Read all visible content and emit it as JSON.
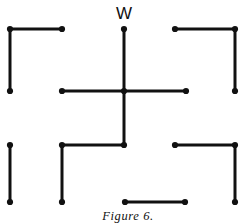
{
  "figure": {
    "caption": "Figure 6.",
    "caption_x": 128,
    "caption_y": 209,
    "vertex_label": "W",
    "vertex_label_x": 124,
    "vertex_label_y": 22,
    "ink_color": "#111111",
    "background_color": "#ffffff",
    "stroke_width": 3,
    "dot_radius": 3.1,
    "width": 242,
    "height": 224
  },
  "chart_data": {
    "type": "diagram",
    "title": "Figure 6.",
    "grid_x": [
      10,
      62,
      124,
      186,
      235
    ],
    "grid_y": [
      29,
      91,
      145,
      202
    ],
    "annotations": [
      {
        "text": "W",
        "x": 124,
        "y": 22,
        "anchor": "bottom-center"
      },
      {
        "text": "Figure 6.",
        "x": 128,
        "y": 209,
        "anchor": "top-center"
      }
    ],
    "segments": [
      {
        "name": "top-left-horizontal",
        "x1": 10,
        "y1": 29,
        "x2": 62,
        "y2": 29
      },
      {
        "name": "top-left-vertical",
        "x1": 10,
        "y1": 29,
        "x2": 10,
        "y2": 91
      },
      {
        "name": "top-center-vertical",
        "x1": 124,
        "y1": 29,
        "x2": 124,
        "y2": 91
      },
      {
        "name": "top-right-horizontal",
        "x1": 175,
        "y1": 29,
        "x2": 235,
        "y2": 29
      },
      {
        "name": "top-right-vertical",
        "x1": 235,
        "y1": 29,
        "x2": 235,
        "y2": 91
      },
      {
        "name": "center-left-horizontal",
        "x1": 62,
        "y1": 91,
        "x2": 124,
        "y2": 91
      },
      {
        "name": "center-right-horizontal",
        "x1": 124,
        "y1": 91,
        "x2": 186,
        "y2": 91
      },
      {
        "name": "center-down-vertical",
        "x1": 124,
        "y1": 91,
        "x2": 124,
        "y2": 145
      },
      {
        "name": "lower-center-horizontal",
        "x1": 62,
        "y1": 145,
        "x2": 124,
        "y2": 145
      },
      {
        "name": "bottom-left-vertical",
        "x1": 10,
        "y1": 145,
        "x2": 10,
        "y2": 202
      },
      {
        "name": "bottom-mid-vertical",
        "x1": 62,
        "y1": 145,
        "x2": 62,
        "y2": 202
      },
      {
        "name": "bottom-right-horizontal",
        "x1": 175,
        "y1": 145,
        "x2": 235,
        "y2": 145
      },
      {
        "name": "bottom-right-vertical",
        "x1": 235,
        "y1": 145,
        "x2": 235,
        "y2": 202
      },
      {
        "name": "bottom-center-horizontal",
        "x1": 125,
        "y1": 202,
        "x2": 185,
        "y2": 202
      }
    ],
    "nodes": [
      {
        "name": "node-top-left",
        "x": 10,
        "y": 29
      },
      {
        "name": "node-top-left-right",
        "x": 62,
        "y": 29
      },
      {
        "name": "node-apex-w",
        "x": 124,
        "y": 29
      },
      {
        "name": "node-top-right-left",
        "x": 175,
        "y": 29
      },
      {
        "name": "node-top-right",
        "x": 235,
        "y": 29
      },
      {
        "name": "node-mid-far-left",
        "x": 10,
        "y": 91
      },
      {
        "name": "node-mid-left",
        "x": 62,
        "y": 91
      },
      {
        "name": "node-center",
        "x": 124,
        "y": 91
      },
      {
        "name": "node-mid-right",
        "x": 186,
        "y": 91
      },
      {
        "name": "node-mid-far-right",
        "x": 235,
        "y": 91
      },
      {
        "name": "node-lower-left",
        "x": 10,
        "y": 145
      },
      {
        "name": "node-lower-mid-left",
        "x": 62,
        "y": 145
      },
      {
        "name": "node-lower-center",
        "x": 124,
        "y": 145
      },
      {
        "name": "node-lower-right-left",
        "x": 175,
        "y": 145
      },
      {
        "name": "node-lower-right",
        "x": 235,
        "y": 145
      },
      {
        "name": "node-bottom-left",
        "x": 10,
        "y": 202
      },
      {
        "name": "node-bottom-mid",
        "x": 62,
        "y": 202
      },
      {
        "name": "node-bottom-center-left",
        "x": 125,
        "y": 202
      },
      {
        "name": "node-bottom-center-right",
        "x": 185,
        "y": 202
      },
      {
        "name": "node-bottom-right",
        "x": 235,
        "y": 202
      }
    ]
  }
}
